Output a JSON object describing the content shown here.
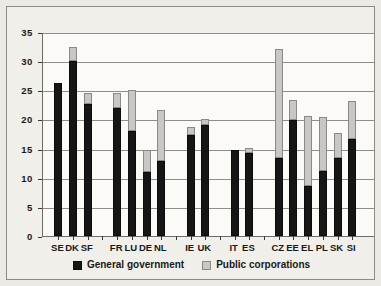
{
  "chart_data": {
    "type": "bar",
    "stacked": true,
    "title": "",
    "subtitle": "",
    "xlabel": "",
    "ylabel": "",
    "ylim": [
      0,
      35
    ],
    "yticks": [
      0,
      5,
      10,
      15,
      20,
      25,
      30,
      35
    ],
    "ytick_labels": [
      "0",
      "5",
      "10",
      "15",
      "20",
      "25",
      "30",
      "35"
    ],
    "grid": "horizontal",
    "legend_position": "bottom-center",
    "categories": [
      "SE",
      "DK",
      "SF",
      "FR",
      "LU",
      "DE",
      "NL",
      "IE",
      "UK",
      "IT",
      "ES",
      "CZ",
      "EE",
      "EL",
      "PL",
      "SK",
      "SI"
    ],
    "group_breaks_after": [
      "SF",
      "NL",
      "UK",
      "ES"
    ],
    "series": [
      {
        "name": "General government",
        "color": "#161616",
        "values": [
          26.3,
          30.0,
          22.6,
          22.0,
          18.1,
          11.0,
          12.9,
          17.3,
          19.0,
          14.8,
          14.3,
          13.3,
          19.9,
          8.6,
          11.2,
          13.4,
          16.6
        ]
      },
      {
        "name": "Public corporations",
        "color": "#c9c7c4",
        "values": [
          0.0,
          2.5,
          2.0,
          2.5,
          7.0,
          3.8,
          8.8,
          1.4,
          1.1,
          0.0,
          0.8,
          18.8,
          3.5,
          12.0,
          9.2,
          4.3,
          6.5
        ]
      }
    ],
    "totals": [
      26.3,
      32.5,
      24.6,
      24.5,
      25.1,
      14.8,
      21.7,
      18.7,
      20.1,
      14.8,
      15.1,
      32.1,
      23.4,
      20.6,
      20.4,
      17.7,
      23.1
    ]
  },
  "legend": {
    "entries": [
      {
        "label": "General government",
        "swatch": "black"
      },
      {
        "label": "Public corporations",
        "swatch": "gray"
      }
    ]
  }
}
